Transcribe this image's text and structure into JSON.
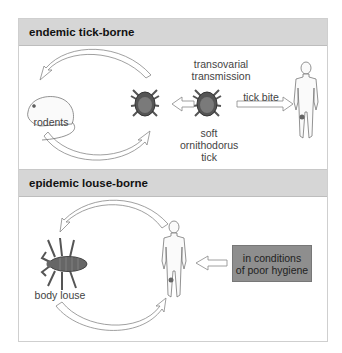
{
  "sections": [
    {
      "title": "endemic tick-borne",
      "labels": {
        "transovarial": "transovarial\ntransmission",
        "rodents": "rodents",
        "tick_bite": "tick bite",
        "soft_tick": "soft\nornithodorus\ntick"
      },
      "icons": [
        "rodent-icon",
        "tick-icon",
        "tick-icon",
        "human-figure-icon",
        "cycle-arrow-icon",
        "arrow-left-icon",
        "arrow-right-icon"
      ]
    },
    {
      "title": "epidemic louse-borne",
      "labels": {
        "body_louse": "body louse",
        "hygiene": "in conditions\nof poor hygiene"
      },
      "icons": [
        "louse-icon",
        "human-figure-icon",
        "cycle-arrow-icon",
        "arrow-left-icon"
      ]
    }
  ],
  "colors": {
    "header_bg": "#d6d6d6",
    "hygiene_box": "#8e8e8e",
    "tick_body": "#6a6a6a",
    "line": "#888888"
  }
}
